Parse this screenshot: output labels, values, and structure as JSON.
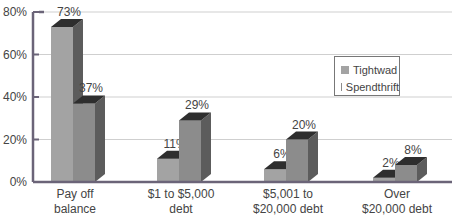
{
  "chart_data": {
    "type": "bar",
    "style": "3d-clustered-column",
    "title": "",
    "xlabel": "",
    "ylabel": "",
    "categories": [
      "Pay off\nbalance",
      "$1 to $5,000\ndebt",
      "$5,001 to\n$20,000 debt",
      "Over\n$20,000 debt"
    ],
    "category_lines": [
      [
        "Pay off",
        "balance"
      ],
      [
        "$1 to $5,000",
        "debt"
      ],
      [
        "$5,001 to",
        "$20,000 debt"
      ],
      [
        "Over",
        "$20,000 debt"
      ]
    ],
    "series": [
      {
        "name": "Tightwad",
        "values": [
          73,
          11,
          6,
          2
        ],
        "labels": [
          "73%",
          "11%",
          "6%",
          "2%"
        ],
        "color": "#a3a3a3"
      },
      {
        "name": "Spendthrift",
        "values": [
          37,
          29,
          20,
          8
        ],
        "labels": [
          "37%",
          "29%",
          "20%",
          "8%"
        ],
        "color": "#8c8c8c"
      }
    ],
    "yticks": [
      "0%",
      "20%",
      "40%",
      "60%",
      "80%"
    ],
    "ylim": [
      0,
      80
    ],
    "grid": true,
    "legend_position": "right-inside"
  },
  "legend": {
    "items": [
      {
        "label": "Tightwad",
        "color": "#a3a3a3"
      },
      {
        "label": "Spendthrift",
        "color": "#8c8c8c"
      }
    ]
  },
  "colors": {
    "axis": "#6b6478",
    "grid": "#cfcfcf",
    "top_face": "#2e2e2e",
    "side_face": "#5c5c5c"
  }
}
